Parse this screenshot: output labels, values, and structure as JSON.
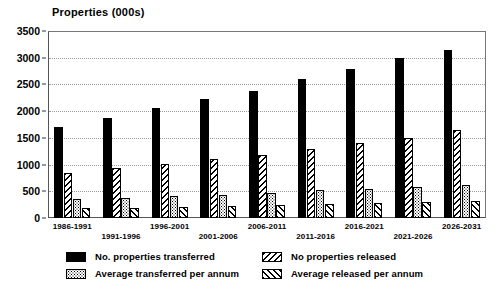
{
  "chart_data": {
    "type": "bar",
    "title": "Properties (000s)",
    "xlabel": "",
    "ylabel": "",
    "ylim": [
      0,
      3500
    ],
    "ytick_step": 500,
    "yticks": [
      0,
      500,
      1000,
      1500,
      2000,
      2500,
      3000,
      3500
    ],
    "grid": true,
    "legend_position": "bottom",
    "categories": [
      "1986-1991",
      "1991-1996",
      "1996-2001",
      "2001-2006",
      "2006-2011",
      "2011-2016",
      "2016-2021",
      "2021-2026",
      "2026-2031"
    ],
    "series": [
      {
        "name": "No. properties transferred",
        "pattern": "solid-black",
        "color": "#000000",
        "values": [
          1700,
          1880,
          2050,
          2220,
          2380,
          2600,
          2780,
          2990,
          3150
        ]
      },
      {
        "name": "No properties released",
        "pattern": "backslash-hatch",
        "color": "#000000",
        "values": [
          850,
          930,
          1020,
          1100,
          1180,
          1300,
          1400,
          1500,
          1650
        ]
      },
      {
        "name": "Average transferred per annum",
        "pattern": "dotted",
        "color": "#000000",
        "values": [
          350,
          370,
          410,
          440,
          470,
          520,
          550,
          580,
          620
        ]
      },
      {
        "name": "Average released per annum",
        "pattern": "forwardslash-hatch",
        "color": "#000000",
        "values": [
          180,
          190,
          200,
          220,
          240,
          260,
          280,
          300,
          310
        ]
      }
    ]
  },
  "legend": {
    "items": [
      {
        "label": "No. properties transferred",
        "swatch": "solid-black-swatch"
      },
      {
        "label": "No properties released",
        "swatch": "backslash-hatch-swatch"
      },
      {
        "label": "Average transferred per annum",
        "swatch": "dotted-swatch"
      },
      {
        "label": "Average released per annum",
        "swatch": "forwardslash-hatch-swatch"
      }
    ]
  }
}
